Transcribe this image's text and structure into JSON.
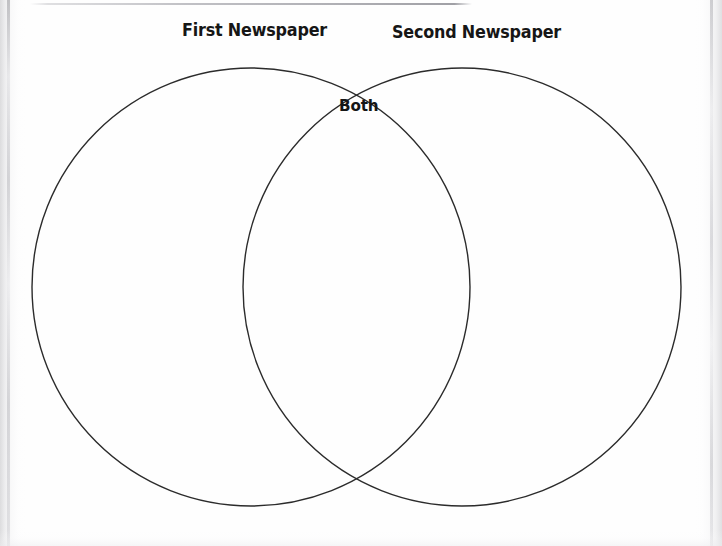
{
  "page": {
    "background_color": "#fefefe",
    "width": 722,
    "height": 546
  },
  "diagram": {
    "type": "venn-2-circle",
    "stroke_color": "#2b2b2b",
    "fill": "none",
    "stroke_width": 1.4,
    "left_circle": {
      "cx": 251,
      "cy": 287,
      "r": 219
    },
    "right_circle": {
      "cx": 462,
      "cy": 287,
      "r": 219
    },
    "intersections": [
      {
        "x": 356,
        "y": 78
      },
      {
        "x": 356,
        "y": 496
      }
    ]
  },
  "labels": {
    "left_title": "First Newspaper",
    "right_title": "Second Newspaper",
    "overlap_title": "Both"
  },
  "artifacts": {
    "top_rule_color": "#a6a6ac",
    "edge_texture_color": "#d8d8db"
  }
}
